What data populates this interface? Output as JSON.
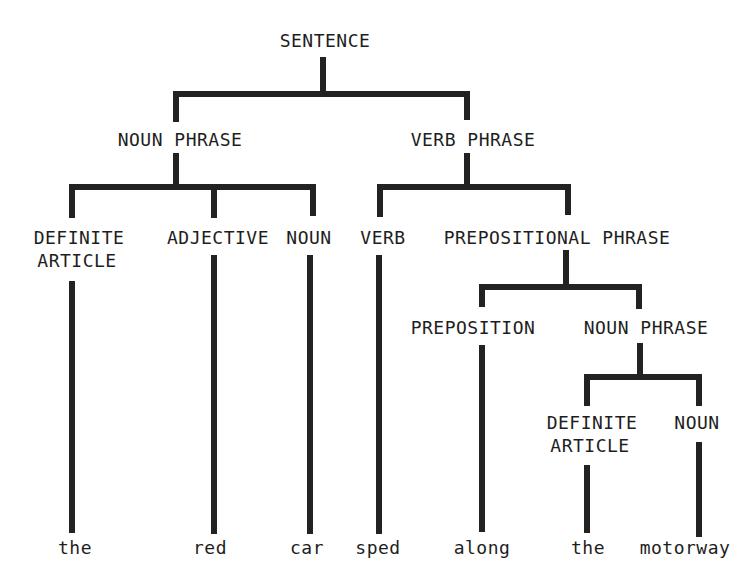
{
  "diagram": {
    "type": "parse-tree",
    "line_color": "#222222",
    "text_color": "#1e1e1e",
    "background": "#ffffff",
    "nodes": {
      "sentence": "SENTENCE",
      "noun_phrase_1": "NOUN PHRASE",
      "verb_phrase": "VERB PHRASE",
      "definite_article_1_line1": "DEFINITE",
      "definite_article_1_line2": "ARTICLE",
      "adjective": "ADJECTIVE",
      "noun_1": "NOUN",
      "verb": "VERB",
      "prepositional_phrase": "PREPOSITIONAL PHRASE",
      "preposition": "PREPOSITION",
      "noun_phrase_2": "NOUN PHRASE",
      "definite_article_2_line1": "DEFINITE",
      "definite_article_2_line2": "ARTICLE",
      "noun_2": "NOUN"
    },
    "words": [
      "the",
      "red",
      "car",
      "sped",
      "along",
      "the",
      "motorway"
    ]
  }
}
